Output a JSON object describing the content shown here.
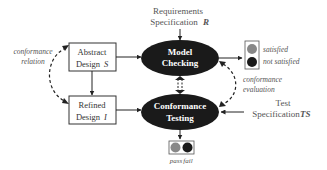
{
  "diagram": {
    "requirements": {
      "line1": "Requirements",
      "line2": "Specification",
      "symbol": "R"
    },
    "abstract_design": {
      "line1": "Abstract",
      "line2": "Design",
      "symbol": "S"
    },
    "refined_design": {
      "line1": "Refined",
      "line2": "Design",
      "symbol": "I"
    },
    "model_checking": {
      "line1": "Model",
      "line2": "Checking"
    },
    "conformance_testing": {
      "line1": "Conformance",
      "line2": "Testing"
    },
    "test_spec": {
      "line1": "Test",
      "line2": "Specification",
      "symbol": "TS"
    },
    "conformance_relation": {
      "line1": "conformance",
      "line2": "relation"
    },
    "conformance_evaluation": {
      "line1": "conformance",
      "line2": "evaluation"
    },
    "mc_result": {
      "satisfied": "satisfied",
      "not_satisfied": "not satisfied"
    },
    "ct_result": {
      "pass": "pass",
      "fail": "fail"
    }
  },
  "colors": {
    "ellipse": "#1a1a1a",
    "gray_light": "#888888",
    "dark": "#1a1a1a",
    "text": "#555555"
  }
}
